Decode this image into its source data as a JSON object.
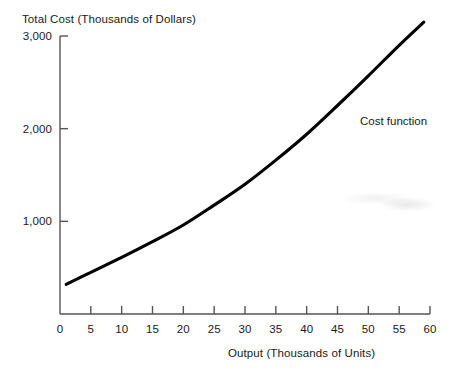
{
  "chart_data": {
    "type": "line",
    "title": "",
    "xlabel": "Output (Thousands of Units)",
    "ylabel": "Total Cost (Thousands of Dollars)",
    "xlim": [
      0,
      60
    ],
    "ylim": [
      0,
      3000
    ],
    "grid": false,
    "legend_position": "inline-annotation",
    "x_ticks": [
      0,
      5,
      10,
      15,
      20,
      25,
      30,
      35,
      40,
      45,
      50,
      55,
      60
    ],
    "x_tick_labels": [
      "0",
      "5",
      "10",
      "15",
      "20",
      "25",
      "30",
      "35",
      "40",
      "45",
      "50",
      "55",
      "60"
    ],
    "y_ticks": [
      1000,
      2000,
      3000
    ],
    "y_tick_labels": [
      "1,000",
      "2,000",
      "3,000"
    ],
    "series": [
      {
        "name": "Cost function",
        "color": "#000000",
        "x": [
          1,
          5,
          10,
          15,
          20,
          25,
          30,
          35,
          40,
          45,
          50,
          55,
          59
        ],
        "values": [
          320,
          450,
          610,
          780,
          960,
          1175,
          1400,
          1660,
          1940,
          2250,
          2570,
          2900,
          3150
        ]
      }
    ],
    "annotations": [
      {
        "text": "Cost function",
        "x": 49,
        "y": 2130
      }
    ]
  },
  "axes": {
    "y_title": "Total Cost (Thousands of Dollars)",
    "x_title": "Output (Thousands of Units)"
  },
  "colors": {
    "curve": "#000000",
    "axis": "#555555",
    "text": "#1a1a1a",
    "background": "#ffffff"
  }
}
